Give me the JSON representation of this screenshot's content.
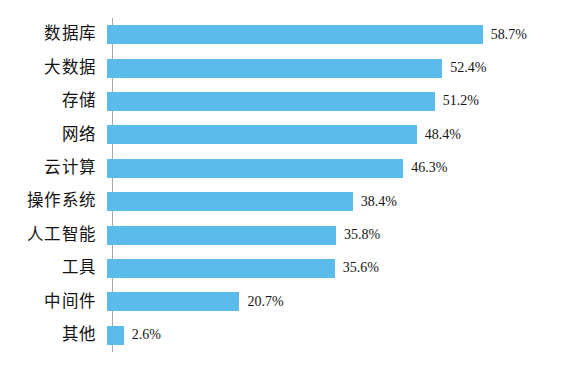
{
  "chart_data": {
    "type": "bar",
    "orientation": "horizontal",
    "title": "",
    "subtitle": "",
    "xlabel": "",
    "ylabel": "",
    "categories": [
      "数据库",
      "大数据",
      "存储",
      "网络",
      "云计算",
      "操作系统",
      "人工智能",
      "工具",
      "中间件",
      "其他"
    ],
    "values": [
      58.7,
      52.4,
      51.2,
      48.4,
      46.3,
      38.4,
      35.8,
      35.6,
      20.7,
      2.6
    ],
    "value_labels": [
      "58.7%",
      "52.4%",
      "51.2%",
      "48.4%",
      "46.3%",
      "38.4%",
      "35.8%",
      "35.6%",
      "20.7%",
      "2.6%"
    ],
    "xlim": [
      0,
      58.7
    ],
    "grid": false,
    "legend": false,
    "bar_color": "#5bbcec",
    "axis_color": "#a9a9a9",
    "background_color": "#ffffff",
    "px_per_percent": 6.4
  }
}
